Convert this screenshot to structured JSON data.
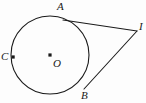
{
  "figure": {
    "background_color": "#fdfdfd",
    "stroke_color": "#1a1a1a",
    "width": 146,
    "height": 103
  },
  "circle": {
    "center_label": "O",
    "center_x": 50,
    "center_y": 55,
    "radius": 39,
    "stroke_width": 1.1
  },
  "points": [
    {
      "name": "A",
      "label": "A",
      "x": 63,
      "y": 20,
      "role": "tangent-point",
      "dot": false
    },
    {
      "name": "B",
      "label": "B",
      "x": 84,
      "y": 89,
      "role": "tangent-point",
      "dot": false
    },
    {
      "name": "C",
      "label": "C",
      "x": 13,
      "y": 57,
      "role": "on-circle",
      "dot": true
    },
    {
      "name": "O",
      "label": "O",
      "x": 50,
      "y": 55,
      "role": "center",
      "dot": true
    },
    {
      "name": "I",
      "label": "I",
      "x": 137,
      "y": 31,
      "role": "external-apex",
      "dot": false
    }
  ],
  "segments": [
    {
      "name": "tangent-A-I",
      "from": "A",
      "to": "I",
      "x1": 63,
      "y1": 20,
      "x2": 137,
      "y2": 31
    },
    {
      "name": "tangent-B-I",
      "from": "B",
      "to": "I",
      "x1": 84,
      "y1": 89,
      "x2": 137,
      "y2": 31
    }
  ]
}
